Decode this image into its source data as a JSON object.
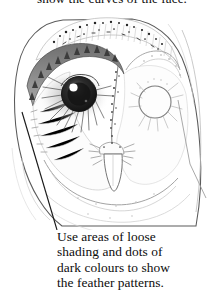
{
  "page": {
    "width": 224,
    "height": 293,
    "background_color": "#ffffff",
    "medium": "pencil-and-ink-illustration"
  },
  "top_caption": {
    "text": "show the curves of the face.",
    "clipped": "top edge cut off by image boundary",
    "color": "#0d0d0d"
  },
  "illustration": {
    "subject": "barn owl head, front view",
    "name": "barn-owl-head-drawing",
    "description": "Heart-shaped facial disc of a barn owl drawn in graphite. The crown is speckled with dark dots and short dashes. The left eye is fully rendered as a dark glossy sphere with a white catchlight and radiating lashes; the right eye is left as a light outline circle to show the work-in-progress stage. A narrow pointed beak sits centred below the eyes.",
    "line_color": "#3a3a3a",
    "shade_color": "#8d8d8d",
    "dark_accent_color": "#1c1c1c",
    "parts": [
      "crown-speckles",
      "facial-disc-outline",
      "left-eye-shaded",
      "right-eye-outline",
      "beak",
      "breast-feather-lines",
      "leader-line"
    ]
  },
  "leader_line": {
    "name": "caption-leader-line",
    "from": "left edge of facial disc",
    "to": "start of caption text",
    "color": "#1a1a1a"
  },
  "bottom_caption": {
    "lines": [
      "Use areas of loose",
      "shading and dots of",
      "dark colours to show",
      "the feather patterns."
    ],
    "full_text": "Use areas of loose shading and dots of dark colours to show the feather patterns.",
    "color": "#0d0d0d"
  }
}
